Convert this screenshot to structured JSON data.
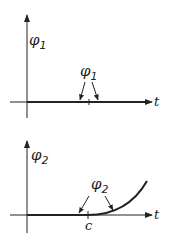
{
  "panels": [
    {
      "id": "top",
      "y_axis_label": "φ",
      "y_axis_sub": "1",
      "x_axis_label": "t",
      "curve_label": "φ",
      "curve_sub": "1",
      "description": "φ1 is identically zero along the t-axis"
    },
    {
      "id": "bottom",
      "y_axis_label": "φ",
      "y_axis_sub": "2",
      "x_axis_label": "t",
      "curve_label": "φ",
      "curve_sub": "2",
      "tick_label": "c",
      "description": "φ2 is zero for t ≤ c and rises for t > c"
    }
  ],
  "colors": {
    "ink": "#222222",
    "background": "#ffffff"
  }
}
